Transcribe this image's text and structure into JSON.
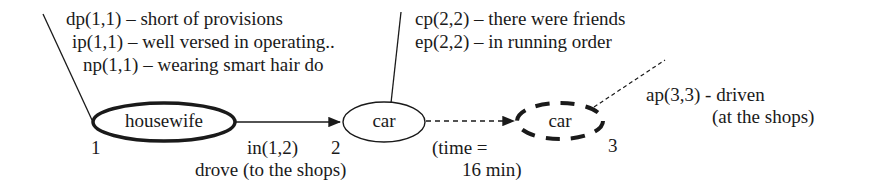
{
  "diagram": {
    "nodes": [
      {
        "id": "1",
        "label": "housewife",
        "number": "1",
        "style": "bold-solid"
      },
      {
        "id": "2",
        "label": "car",
        "number": "2",
        "style": "thin-solid"
      },
      {
        "id": "3",
        "label": "car",
        "number": "3",
        "style": "bold-dashed"
      }
    ],
    "node1_annotations": [
      "dp(1,1) – short of provisions",
      "ip(1,1) – well versed in operating..",
      "np(1,1) – wearing smart hair do"
    ],
    "node2_annotations": [
      "cp(2,2) – there were friends",
      "ep(2,2) – in running order"
    ],
    "node3_annotations": [
      "ap(3,3) - driven",
      "(at the shops)"
    ],
    "edges": [
      {
        "from": "1",
        "to": "2",
        "label": "in(1,2)",
        "sublabel": "drove (to the shops)",
        "style": "solid"
      },
      {
        "from": "2",
        "to": "3",
        "label": "(time =",
        "sublabel": "16 min)",
        "style": "dashed"
      }
    ]
  }
}
